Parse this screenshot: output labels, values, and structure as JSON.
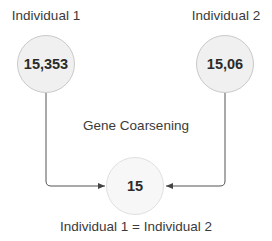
{
  "diagram": {
    "nodes": [
      {
        "id": "ind1",
        "title": "Individual 1",
        "value": "15,353"
      },
      {
        "id": "ind2",
        "title": "Individual 2",
        "value": "15,06"
      },
      {
        "id": "result",
        "value": "15"
      }
    ],
    "process_label": "Gene Coarsening",
    "result_caption": "Individual 1 = Individual 2",
    "edges": [
      {
        "from": "ind1",
        "to": "result"
      },
      {
        "from": "ind2",
        "to": "result"
      }
    ],
    "colors": {
      "node_fill": "#f0f0f0",
      "node_border": "#c9c9c9",
      "edge": "#444444"
    }
  }
}
